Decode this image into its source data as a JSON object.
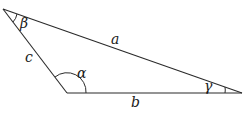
{
  "diagram": {
    "type": "triangle",
    "vertices": {
      "top": {
        "x": 3,
        "y": 9
      },
      "bottom_left": {
        "x": 67,
        "y": 93
      },
      "right": {
        "x": 242,
        "y": 93
      }
    },
    "sides": {
      "a": "a",
      "b": "b",
      "c": "c"
    },
    "angles": {
      "alpha": "α",
      "beta": "β",
      "gamma": "γ"
    },
    "colors": {
      "stroke": "#2a2a2a",
      "text": "#1a1a1a",
      "background": "#ffffff"
    }
  }
}
